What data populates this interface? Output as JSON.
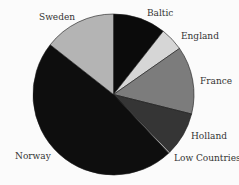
{
  "chart_data": {
    "type": "pie",
    "title": "",
    "start": "12 o'clock",
    "direction": "clockwise",
    "slices": [
      {
        "label": "Baltic",
        "value": 10.6,
        "color": "#0b0b0b"
      },
      {
        "label": "England",
        "value": 4.7,
        "color": "#d6d6d6"
      },
      {
        "label": "France",
        "value": 13.6,
        "color": "#7c7c7c"
      },
      {
        "label": "Holland",
        "value": 8.8,
        "color": "#353535"
      },
      {
        "label": "Low Countries",
        "value": 0.3,
        "color": "#b8b8b8"
      },
      {
        "label": "Norway",
        "value": 47.6,
        "color": "#0e0e0e"
      },
      {
        "label": "Sweden",
        "value": 14.4,
        "color": "#b4b4b4"
      }
    ],
    "legend": "none (labels beside slices)"
  }
}
